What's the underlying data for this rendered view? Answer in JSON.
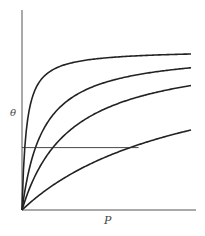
{
  "chart_data": {
    "type": "line",
    "title": "",
    "xlabel": "P",
    "ylabel": "θ",
    "xlim": [
      0,
      10
    ],
    "ylim": [
      0,
      1.25
    ],
    "grid": false,
    "legend": null,
    "tick_labels": false,
    "x": [
      0,
      0.25,
      0.5,
      1,
      1.5,
      2,
      3,
      4,
      5,
      6,
      7,
      8,
      9,
      10
    ],
    "series": [
      {
        "name": "curve-1",
        "K": 3.9,
        "values": [
          0,
          0.494,
          0.661,
          0.796,
          0.854,
          0.886,
          0.921,
          0.94,
          0.951,
          0.959,
          0.965,
          0.969,
          0.972,
          0.975
        ]
      },
      {
        "name": "curve-2",
        "K": 0.8,
        "values": [
          0,
          0.167,
          0.286,
          0.444,
          0.545,
          0.615,
          0.706,
          0.762,
          0.8,
          0.828,
          0.848,
          0.865,
          0.878,
          0.889
        ]
      },
      {
        "name": "curve-3",
        "K": 0.35,
        "values": [
          0,
          0.08,
          0.149,
          0.259,
          0.344,
          0.412,
          0.512,
          0.583,
          0.636,
          0.677,
          0.71,
          0.737,
          0.759,
          0.778
        ]
      },
      {
        "name": "curve-4",
        "K": 0.1,
        "values": [
          0,
          0.024,
          0.048,
          0.091,
          0.13,
          0.167,
          0.231,
          0.286,
          0.333,
          0.375,
          0.412,
          0.444,
          0.474,
          0.5
        ]
      }
    ],
    "annotations": [
      {
        "type": "hline",
        "y": 0.39,
        "x_start": 0,
        "x_end": 6.9,
        "note": "horizontal reference line at constant coverage"
      }
    ]
  },
  "labels": {
    "x_axis": "P",
    "y_axis": "θ"
  }
}
